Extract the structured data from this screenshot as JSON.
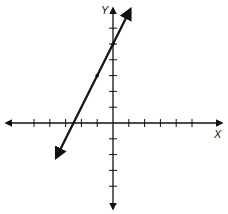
{
  "chart_data": {
    "type": "line",
    "title": "",
    "xlabel": "X",
    "ylabel": "Y",
    "xlim": [
      -5,
      6
    ],
    "ylim": [
      -5,
      6
    ],
    "grid": false,
    "axis_ticks": {
      "x": [
        -5,
        -4,
        -3,
        -2,
        -1,
        1,
        2,
        3,
        4,
        5
      ],
      "y": [
        -4,
        -3,
        -2,
        -1,
        1,
        2,
        3,
        4,
        5,
        6
      ]
    },
    "tick_labels_shown": false,
    "series": [
      {
        "name": "line",
        "equation": "y = 2x + 5",
        "slope": 2,
        "y_intercept": 5,
        "x_intercept": -2.5,
        "marked_points": [
          {
            "x": -1,
            "y": 3
          },
          {
            "x": 0,
            "y": 5
          }
        ],
        "extent": {
          "x": [
            -3.6,
            1.1
          ]
        },
        "arrows_both_ends": true
      }
    ]
  }
}
